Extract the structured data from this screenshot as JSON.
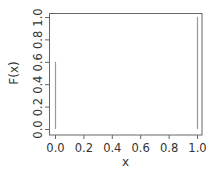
{
  "chart_data": {
    "type": "line",
    "subtype": "spikes",
    "title": "",
    "xlabel": "x",
    "ylabel": "F(x)",
    "x": [
      0,
      1
    ],
    "values": [
      0.6,
      1.0
    ],
    "series": [
      {
        "name": "F(x)",
        "x": [
          0,
          1
        ],
        "values": [
          0.6,
          1.0
        ]
      }
    ],
    "xlim": [
      0,
      1
    ],
    "ylim": [
      0,
      1
    ],
    "x_ticks": [
      "0.0",
      "0.2",
      "0.4",
      "0.6",
      "0.8",
      "1.0"
    ],
    "y_ticks": [
      "0.0",
      "0.2",
      "0.4",
      "0.6",
      "0.8",
      "1.0"
    ],
    "grid": false,
    "legend": null
  },
  "colors": {
    "box": "#666666",
    "spike": "#999999",
    "text": "#333333"
  }
}
